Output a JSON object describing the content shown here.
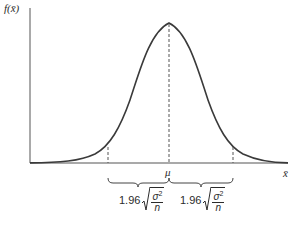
{
  "figure": {
    "y_axis_label": "f(x̄)",
    "x_axis_label": "x̄",
    "center_label": "μ",
    "curve": "normal density",
    "left_interval": {
      "coefficient": "1.96",
      "numerator": "σ",
      "exponent": "2",
      "denominator": "n"
    },
    "right_interval": {
      "coefficient": "1.96",
      "numerator": "σ",
      "exponent": "2",
      "denominator": "n"
    }
  },
  "colors": {
    "line": "#3a3a3a",
    "dash": "#555555",
    "text": "#2b2b2b"
  }
}
